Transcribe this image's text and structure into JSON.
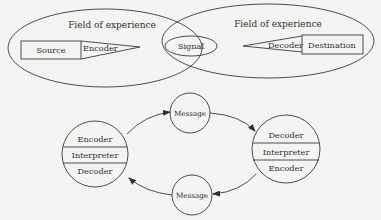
{
  "colors": {
    "background": "#f4f4f2",
    "stroke": "#3a3a3a",
    "text": "#2e2e2e"
  },
  "top_model": {
    "left_field": {
      "label": "Field of experience"
    },
    "right_field": {
      "label": "Field of experience"
    },
    "source": {
      "label": "Source"
    },
    "encoder": {
      "label": "Encoder"
    },
    "signal": {
      "label": "Signal"
    },
    "decoder": {
      "label": "Decoder"
    },
    "destination": {
      "label": "Destination"
    }
  },
  "bottom_model": {
    "left_party": {
      "layers": [
        "Encoder",
        "Interpreter",
        "Decoder"
      ]
    },
    "right_party": {
      "layers": [
        "Decoder",
        "Interpreter",
        "Encoder"
      ]
    },
    "top_message": {
      "label": "Message"
    },
    "bottom_message": {
      "label": "Message"
    }
  }
}
